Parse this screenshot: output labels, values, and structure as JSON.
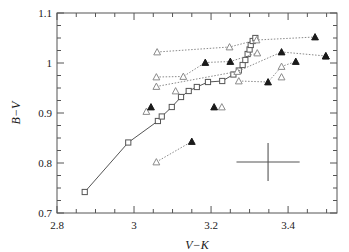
{
  "chart_data": {
    "type": "scatter",
    "title": "",
    "xlabel": "V−K",
    "ylabel": "B−V",
    "xlim": [
      2.8,
      3.527
    ],
    "ylim": [
      0.7,
      1.1
    ],
    "grid": false,
    "legend": "none",
    "xticks_major": [
      2.8,
      3.0,
      3.2,
      3.4
    ],
    "xticklabels": [
      "2.8",
      "3",
      "3.2",
      "3.4"
    ],
    "yticks_major": [
      0.7,
      0.8,
      0.9,
      1.0,
      1.1
    ],
    "yticklabels": [
      "0.7",
      "0.8",
      "0.9",
      "1",
      "1.1"
    ],
    "xtick_minor_step": 0.05,
    "ytick_minor_step": 0.025,
    "series": [
      {
        "name": "fiducial-sequence",
        "marker": "open-square",
        "line": "solid",
        "color": "#555555",
        "points": [
          [
            2.872,
            0.742
          ],
          [
            2.985,
            0.841
          ],
          [
            3.062,
            0.884
          ],
          [
            3.072,
            0.893
          ],
          [
            3.098,
            0.912
          ],
          [
            3.122,
            0.932
          ],
          [
            3.142,
            0.944
          ],
          [
            3.163,
            0.952
          ],
          [
            3.192,
            0.962
          ],
          [
            3.229,
            0.964
          ],
          [
            3.258,
            0.977
          ],
          [
            3.272,
            0.985
          ],
          [
            3.282,
            0.996
          ],
          [
            3.289,
            1.006
          ],
          [
            3.295,
            1.018
          ],
          [
            3.3,
            1.027
          ],
          [
            3.303,
            1.036
          ],
          [
            3.308,
            1.044
          ],
          [
            3.315,
            1.05
          ]
        ]
      },
      {
        "name": "track-a",
        "marker": "mixed",
        "line": "dotted",
        "color": "#8a8a8a",
        "points": [
          [
            3.06,
            1.022
          ],
          [
            3.248,
            1.032
          ],
          [
            3.318,
            1.046
          ],
          [
            3.47,
            1.052
          ]
        ],
        "filled_flags": [
          false,
          false,
          false,
          true
        ]
      },
      {
        "name": "track-b",
        "marker": "mixed",
        "line": "dotted",
        "color": "#8a8a8a",
        "points": [
          [
            3.058,
            0.972
          ],
          [
            3.128,
            0.973
          ],
          [
            3.185,
            1.001
          ],
          [
            3.25,
            1.003
          ],
          [
            3.32,
            1.02
          ]
        ],
        "filled_flags": [
          false,
          false,
          true,
          true,
          false
        ]
      },
      {
        "name": "track-c",
        "marker": "mixed",
        "line": "dotted",
        "color": "#8a8a8a",
        "points": [
          [
            3.058,
            0.953
          ],
          [
            3.268,
            0.983
          ],
          [
            3.383,
            1.022
          ],
          [
            3.498,
            1.014
          ]
        ],
        "filled_flags": [
          false,
          false,
          true,
          true
        ]
      },
      {
        "name": "track-d",
        "marker": "mixed",
        "line": "dotted",
        "color": "#8a8a8a",
        "points": [
          [
            3.272,
            0.964
          ],
          [
            3.348,
            0.962
          ],
          [
            3.383,
            0.993
          ],
          [
            3.42,
            1.003
          ]
        ],
        "filled_flags": [
          false,
          true,
          false,
          true
        ]
      },
      {
        "name": "track-e",
        "marker": "mixed",
        "line": "dotted",
        "color": "#8a8a8a",
        "points": [
          [
            3.058,
            0.802
          ],
          [
            3.15,
            0.843
          ]
        ],
        "filled_flags": [
          false,
          true
        ]
      },
      {
        "name": "track-f",
        "marker": "mixed",
        "line": "dotted",
        "color": "#8a8a8a",
        "points": [
          [
            3.032,
            0.903
          ],
          [
            3.044,
            0.912
          ]
        ],
        "filled_flags": [
          false,
          true
        ]
      },
      {
        "name": "isolated-pair-low",
        "marker": "mixed",
        "line": "none",
        "color": "#8a8a8a",
        "points": [
          [
            3.208,
            0.912
          ],
          [
            3.228,
            0.912
          ]
        ],
        "filled_flags": [
          true,
          false
        ]
      },
      {
        "name": "isolated-open-triangles",
        "marker": "open-triangle",
        "line": "none",
        "color": "#8a8a8a",
        "points": [
          [
            3.108,
            0.944
          ],
          [
            3.383,
            0.972
          ]
        ]
      },
      {
        "name": "isolated-filled-triangles",
        "marker": "filled-triangle",
        "line": "none",
        "color": "#1a1a1a",
        "points": [
          [
            3.498,
            1.014
          ]
        ]
      }
    ],
    "error_bar": {
      "name": "representative-error-cross",
      "x": 3.348,
      "y": 0.802,
      "xerr": 0.082,
      "yerr": 0.038
    }
  },
  "figure": {
    "frame_color": "#555555",
    "background": "#ffffff"
  }
}
